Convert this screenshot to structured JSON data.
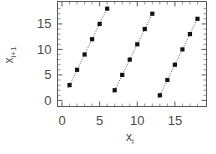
{
  "chart_data": {
    "type": "scatter",
    "title": "",
    "subtitle": "",
    "xlabel": "x_i",
    "ylabel": "x_i+1",
    "xlim": [
      -0.6,
      19.2
    ],
    "ylim": [
      -1.2,
      19.4
    ],
    "grid": false,
    "legend": null,
    "marker_style": "filled-square",
    "trendline_style": "dotted",
    "xticks": [
      0,
      5,
      10,
      15
    ],
    "yticks": [
      0,
      5,
      10,
      15
    ],
    "xticklabels": [
      "0",
      "5",
      "10",
      "15"
    ],
    "yticklabels": [
      "0",
      "5",
      "10",
      "15"
    ],
    "xminorticks": [
      1,
      2,
      3,
      4,
      6,
      7,
      8,
      9,
      11,
      12,
      13,
      14,
      16,
      17,
      18
    ],
    "yminorticks": [
      1,
      2,
      3,
      4,
      6,
      7,
      8,
      9,
      11,
      12,
      13,
      14,
      16,
      17,
      18
    ],
    "series": [
      {
        "name": "branch-1",
        "x": [
          1,
          2,
          3,
          4,
          5,
          6
        ],
        "y": [
          3,
          6,
          9,
          12,
          15,
          18
        ],
        "trendline": {
          "x0": 0.85,
          "y0": 2.5,
          "x1": 6.15,
          "y1": 18.5
        }
      },
      {
        "name": "branch-2",
        "x": [
          7,
          8,
          9,
          10,
          11,
          12
        ],
        "y": [
          2,
          5,
          8,
          11,
          14,
          17
        ],
        "trendline": {
          "x0": 6.85,
          "y0": 1.5,
          "x1": 12.15,
          "y1": 17.5
        }
      },
      {
        "name": "branch-3",
        "x": [
          13,
          14,
          15,
          16,
          17,
          18
        ],
        "y": [
          1,
          4,
          7,
          10,
          13,
          16
        ],
        "trendline": {
          "x0": 12.85,
          "y0": 0.5,
          "x1": 18.15,
          "y1": 16.5
        }
      }
    ]
  },
  "axis": {
    "x_label_base": "x",
    "x_label_sub": "i",
    "y_label_base": "x",
    "y_label_sub": "i+1"
  },
  "colors": {
    "marker": "#121212",
    "frame": "#5a5a5a",
    "trendline": "#555555",
    "text": "#4a4a4a",
    "background": "#ffffff"
  }
}
